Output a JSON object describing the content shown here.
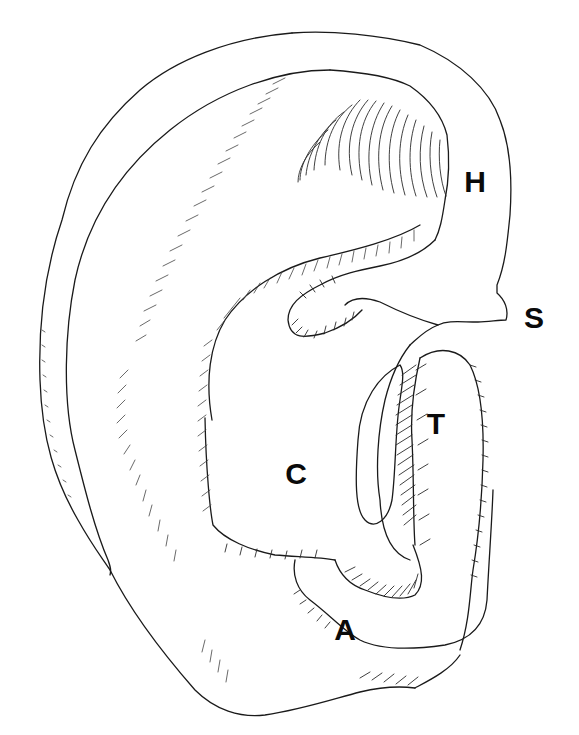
{
  "figure": {
    "background": "#ffffff",
    "line_color": "#1a1a1a",
    "labels": [
      {
        "id": "H",
        "text": "H",
        "x": 475,
        "y": 181
      },
      {
        "id": "S",
        "text": "S",
        "x": 534,
        "y": 317
      },
      {
        "id": "T",
        "text": "T",
        "x": 436,
        "y": 423
      },
      {
        "id": "C",
        "text": "C",
        "x": 296,
        "y": 473
      },
      {
        "id": "A",
        "text": "A",
        "x": 345,
        "y": 629
      }
    ]
  }
}
